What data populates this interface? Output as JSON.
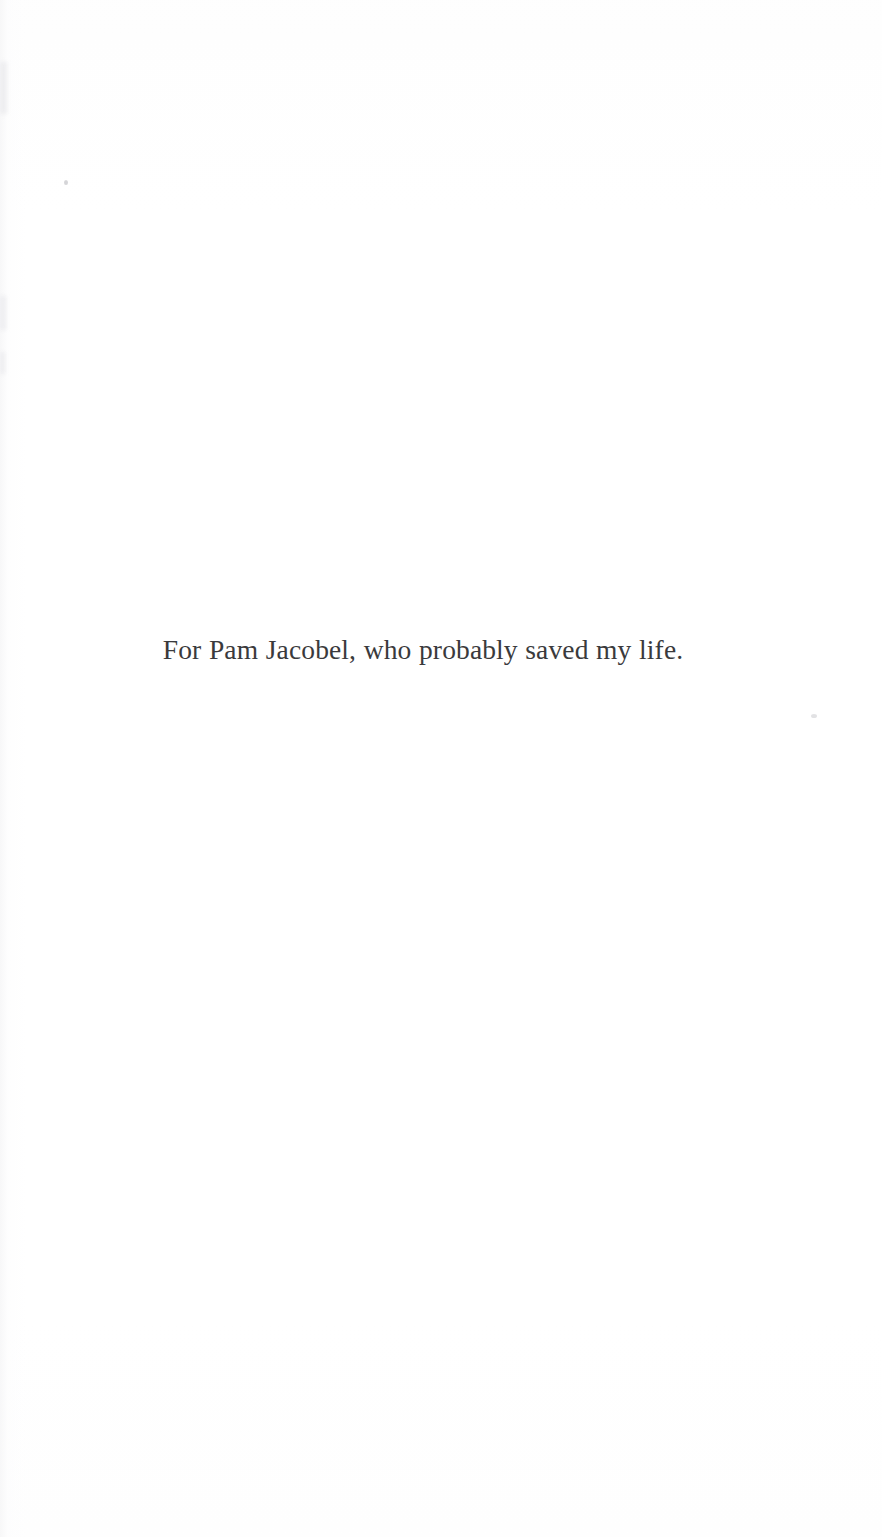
{
  "page": {
    "kind": "book-dedication-page",
    "width": 882,
    "height": 1537,
    "background_color": "#ffffff"
  },
  "dedication": {
    "text": "For Pam Jacobel, who probably saved my life.",
    "ink_color": "#3a3a3c",
    "font_size_px": 27.5,
    "baseline_y": 665,
    "text_left_x": 172,
    "text_right_x": 641
  },
  "artifacts": {
    "description": "faint scanner marks",
    "specks": [
      {
        "name": "speck-upper-left",
        "x": 64,
        "y": 180
      },
      {
        "name": "speck-right",
        "x": 811,
        "y": 714
      }
    ],
    "edge_marks": [
      {
        "name": "edge-mark-top",
        "x": 0,
        "y": 62
      },
      {
        "name": "edge-mark-middle",
        "x": 0,
        "y": 296
      },
      {
        "name": "edge-mark-lower",
        "x": 0,
        "y": 352
      }
    ]
  }
}
